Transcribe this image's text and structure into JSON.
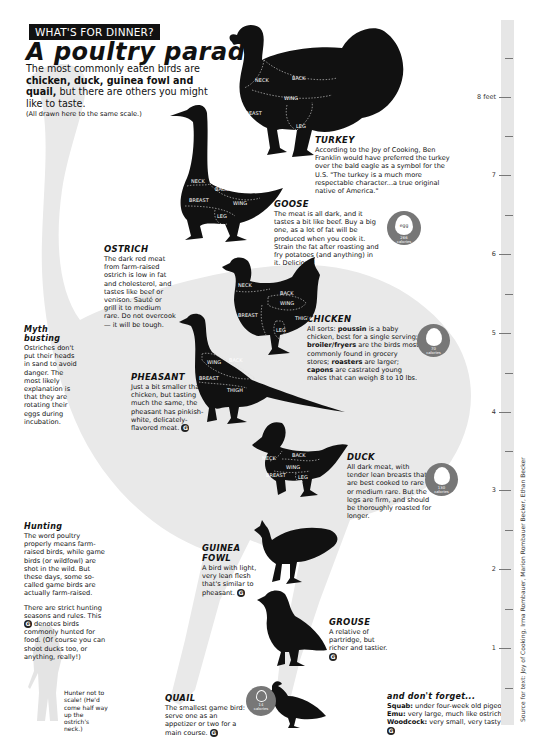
{
  "header": {
    "kicker": "WHAT'S FOR DINNER?",
    "title": "A poultry parade",
    "deck_parts": [
      "The most commonly eaten birds are ",
      "chicken, duck, guinea fowl and quail,",
      " but there are others you might like to taste."
    ],
    "scale_note": "(All drawn here to the same scale.)"
  },
  "birds": {
    "turkey": {
      "name": "TURKEY",
      "cuts": [
        "NECK",
        "BACK",
        "WING",
        "BREAST",
        "LEG"
      ],
      "text": "According to the Joy of Cooking, Ben Franklin would have preferred the turkey over the bald eagle as a symbol for the U.S. \"The turkey is a much more respectable character...a true original native of America.\""
    },
    "goose": {
      "name": "GOOSE",
      "cuts": [
        "NECK",
        "BACK",
        "BREAST",
        "WING",
        "LEG"
      ],
      "text": "The meat is all dark, and it tastes a bit like beef. Buy a big one, as a lot of fat will be produced when you cook it. Strain the fat after roasting and fry potatoes (and anything) in it. Delicious!",
      "badge": {
        "egg_label": "egg",
        "calories": "266",
        "unit": "calories"
      }
    },
    "ostrich": {
      "name": "OSTRICH",
      "text": "The dark red meat from farm-raised ostrich is low in fat and cholesterol, and tastes like beef or venison. Sauté or grill it to medium rare. Do not overcook — it will be tough."
    },
    "chicken": {
      "name": "CHICKEN",
      "cuts": [
        "NECK",
        "BACK",
        "WING",
        "BREAST",
        "THIGH",
        "LEG"
      ],
      "text_parts": [
        "All sorts: ",
        "poussin",
        " is a baby chicken, best for a single serving; ",
        "broiler/fryers",
        " are the birds most commonly found in grocery stores; ",
        "roasters",
        " are larger; ",
        "capons",
        " are castrated young males that can weigh 8 to 10 lbs."
      ],
      "badge": {
        "calories": "70",
        "unit": "calories"
      }
    },
    "pheasant": {
      "name": "PHEASANT",
      "cuts": [
        "WING",
        "BACK",
        "BREAST",
        "THIGH"
      ],
      "text": "Just a bit smaller than a chicken, but tasting much the same, the pheasant has pinkish-white, delicately-flavored meat.",
      "game": true
    },
    "duck": {
      "name": "DUCK",
      "cuts": [
        "NECK",
        "BACK",
        "WING",
        "BREAST",
        "LEG"
      ],
      "text": "All dark meat, with tender lean breasts that are best cooked to rare or medium rare. But the legs are firm, and should be thoroughly roasted for longer.",
      "badge": {
        "calories": "130",
        "unit": "calories"
      }
    },
    "guinea_fowl": {
      "name": "GUINEA FOWL",
      "text": "A bird with light, very lean flesh that's similar to pheasant.",
      "game": true
    },
    "grouse": {
      "name": "GROUSE",
      "text": "A relative of partridge, but richer and tastier.",
      "game": true
    },
    "quail": {
      "name": "QUAIL",
      "text": "The smallest game bird: serve one as an appetizer or two for a main course.",
      "game": true,
      "badge": {
        "calories": "14",
        "unit": "calories"
      }
    }
  },
  "sidebars": {
    "myth": {
      "title": "Myth busting",
      "text": "Ostriches don't put their heads in sand to avoid danger. The most likely explanation is that they are rotating their eggs during incubation."
    },
    "hunting": {
      "title": "Hunting",
      "p1": "The word poultry properly means farm-raised birds, while game birds (or wildfowl) are shot in the wild. But these days, some so-called game birds are actually farm-raised.",
      "p2a": "There are strict hunting seasons and rules. This ",
      "p2b": " denotes birds commonly hunted for food. (Of course you can shoot ducks too, or anything, really!)"
    },
    "hunter_note": "Hunter not to scale! (He'd come half way up the ostrich's neck.)",
    "dont_forget": {
      "title": "and don't forget...",
      "items": [
        {
          "label": "Squab:",
          "text": " under four-week old pigeon"
        },
        {
          "label": "Emu:",
          "text": " very large, much like ostrich"
        },
        {
          "label": "Woodcock:",
          "text": " very small, very tasty"
        }
      ]
    }
  },
  "game_icon": "G",
  "ruler": {
    "labels": [
      {
        "text": "8 feet",
        "y": 97
      },
      {
        "text": "7",
        "y": 175
      },
      {
        "text": "6",
        "y": 254
      },
      {
        "text": "5",
        "y": 333
      },
      {
        "text": "4",
        "y": 412
      },
      {
        "text": "3",
        "y": 490
      },
      {
        "text": "2",
        "y": 569
      },
      {
        "text": "1",
        "y": 648
      }
    ]
  },
  "source": "Source for text: Joy of Cooking, Irma Rombauer, Marion Rombauer Becker, Ethan Becker",
  "colors": {
    "silhouette": "#111111",
    "ghost": "#e8e8e8",
    "badge": "#777777",
    "ruler": "#e6e6e6"
  }
}
